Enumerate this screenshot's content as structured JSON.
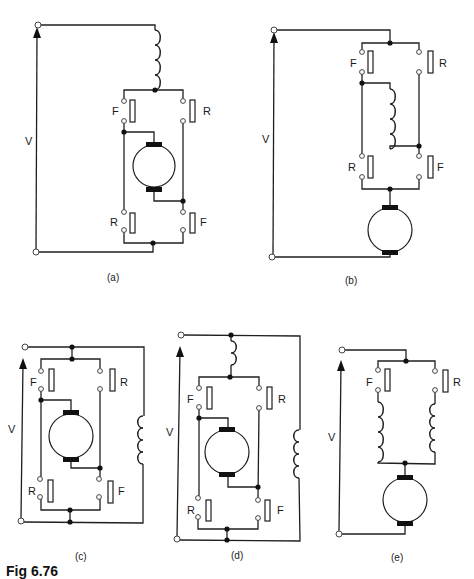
{
  "figure": {
    "caption": "Fig 6.76",
    "panels": [
      {
        "id": "a",
        "label": "(a)",
        "voltage_label": "V",
        "top_switches": [
          "F",
          "R"
        ],
        "bottom_switches": [
          "R",
          "F"
        ],
        "description": "Series field above reversing bridge; armature inside bridge"
      },
      {
        "id": "b",
        "label": "(b)",
        "voltage_label": "V",
        "top_switches": [
          "F",
          "R"
        ],
        "bottom_switches": [
          "R",
          "F"
        ],
        "description": "Field winding inside reversing bridge; armature in series below"
      },
      {
        "id": "c",
        "label": "(c)",
        "voltage_label": "V",
        "top_switches": [
          "F",
          "R"
        ],
        "bottom_switches": [
          "R",
          "F"
        ],
        "description": "Armature in reversing bridge; shunt field across supply"
      },
      {
        "id": "d",
        "label": "(d)",
        "voltage_label": "V",
        "top_switches": [
          "F",
          "R"
        ],
        "bottom_switches": [
          "R",
          "F"
        ],
        "description": "Compound: series field above armature bridge; shunt field across supply"
      },
      {
        "id": "e",
        "label": "(e)",
        "voltage_label": "V",
        "top_switches": [
          "F",
          "R"
        ],
        "bottom_switches": [],
        "description": "Split series field: forward and reverse windings, each with own contactor, armature below"
      }
    ],
    "legend": {
      "F": "Forward contactor",
      "R": "Reverse contactor",
      "V": "Supply voltage"
    },
    "colors": {
      "line": "#1f1f1f",
      "background": "#ffffff"
    }
  }
}
